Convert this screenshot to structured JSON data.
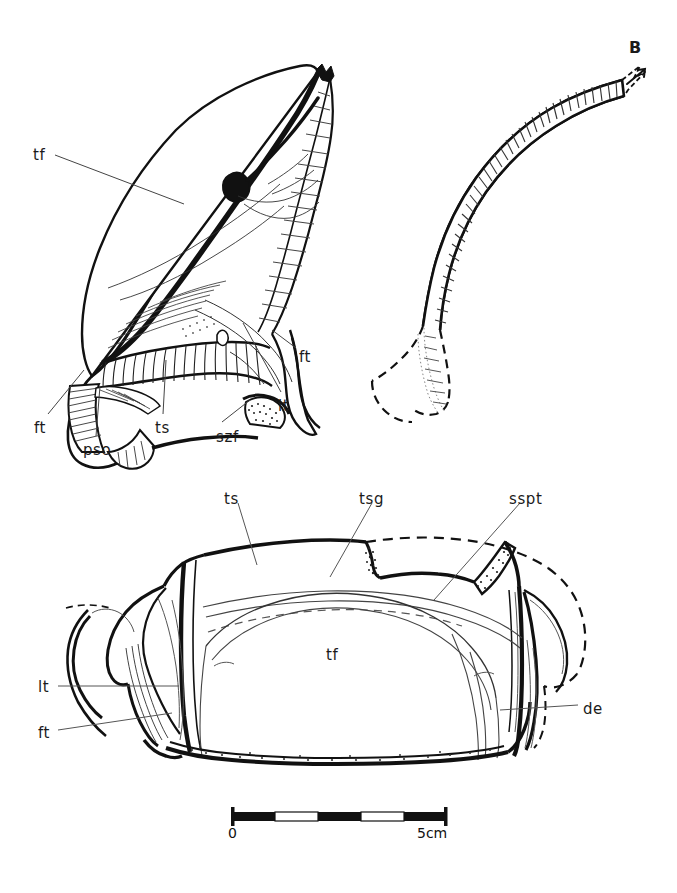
{
  "figure": {
    "panel_letter": "B",
    "background_color": "#ffffff",
    "ink_color": "#111111"
  },
  "labels": {
    "upper_left_view": [
      {
        "id": "tf-upper",
        "text": "tf",
        "x": 33,
        "y": 148
      },
      {
        "id": "ft-right",
        "text": "ft",
        "x": 299,
        "y": 350
      },
      {
        "id": "lt-right",
        "text": "lt",
        "x": 278,
        "y": 399
      },
      {
        "id": "ft-lower",
        "text": "ft",
        "x": 34,
        "y": 421
      },
      {
        "id": "pso",
        "text": "pso",
        "x": 83,
        "y": 443
      },
      {
        "id": "ts-upper",
        "text": "ts",
        "x": 155,
        "y": 421
      },
      {
        "id": "szf",
        "text": "szf",
        "x": 216,
        "y": 430
      }
    ],
    "upper_right_view": [
      {
        "id": "panel-b",
        "text": "B",
        "x": 629,
        "y": 40
      }
    ],
    "lower_view": [
      {
        "id": "ts-lower",
        "text": "ts",
        "x": 224,
        "y": 492
      },
      {
        "id": "tsg",
        "text": "tsg",
        "x": 359,
        "y": 492
      },
      {
        "id": "sspt",
        "text": "sspt",
        "x": 509,
        "y": 492
      },
      {
        "id": "tf-lower",
        "text": "tf",
        "x": 326,
        "y": 648
      },
      {
        "id": "lt-lower",
        "text": "lt",
        "x": 38,
        "y": 680
      },
      {
        "id": "ft-bottom",
        "text": "ft",
        "x": 38,
        "y": 726
      },
      {
        "id": "de",
        "text": "de",
        "x": 583,
        "y": 702
      }
    ]
  },
  "abbreviations": {
    "tf": "tf",
    "ft": "ft",
    "lt": "lt",
    "ts": "ts",
    "pso": "pso",
    "szf": "szf",
    "tsg": "tsg",
    "sspt": "sspt",
    "de": "de"
  },
  "scale_bar": {
    "start_label": "0",
    "end_label": "5cm",
    "units": "cm",
    "total_length_cm": 5,
    "segments": 5,
    "segment_colors": [
      "#111111",
      "#ffffff",
      "#111111",
      "#ffffff",
      "#111111"
    ],
    "x_start": 232,
    "x_end": 447,
    "y": 816,
    "bar_height": 9
  },
  "caption": {
    "text": ""
  }
}
